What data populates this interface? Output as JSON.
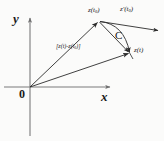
{
  "figure": {
    "kind": "complex-plane-curve-diagram",
    "background_color": "#fbfbfa",
    "ink_color": "#2b2b2b",
    "width": 164,
    "height": 141,
    "axes": {
      "x_label": "x",
      "y_label": "y",
      "origin_label": "0",
      "origin_px": [
        30,
        87
      ],
      "x_axis": {
        "from_px": [
          4,
          87
        ],
        "to_px": [
          112,
          87
        ],
        "arrow": true
      },
      "y_axis": {
        "from_px": [
          30,
          133
        ],
        "to_px": [
          30,
          17
        ],
        "arrow": true
      }
    },
    "points": {
      "z_t0": {
        "label_html": "z(t<sub>0</sub>)",
        "label_plain": "z(t0)",
        "px": [
          99,
          21
        ]
      },
      "z_t": {
        "label_html": "z(t)",
        "label_plain": "z(t)",
        "px": [
          130,
          53
        ]
      }
    },
    "vectors": [
      {
        "name": "position-vector-z-t0",
        "label_plain": "z(t0)",
        "from_px": [
          30,
          87
        ],
        "to_px": [
          99,
          21
        ],
        "style": "straight-arrow"
      },
      {
        "name": "position-vector-z-t",
        "label_plain": "z(t)",
        "from_px": [
          30,
          87
        ],
        "to_px": [
          130,
          53
        ],
        "style": "straight-arrow"
      },
      {
        "name": "chord-vector",
        "label_html": "[z(t)-z(t<sub>0</sub>)]",
        "label_plain": "[z(t)-z(t0)]",
        "from_px": [
          99,
          21
        ],
        "to_px": [
          130,
          53
        ],
        "style": "straight-arrow"
      },
      {
        "name": "tangent-vector",
        "label_html": "z&#8242;(t<sub>0</sub>)",
        "label_plain": "z'(t0)",
        "from_px": [
          99,
          21
        ],
        "to_px": [
          160,
          31
        ],
        "style": "straight-arrow"
      }
    ],
    "curve": {
      "name": "curve-C",
      "label": "C",
      "label_px": [
        118,
        37
      ],
      "from_px": [
        99,
        21
      ],
      "to_px": [
        130,
        53
      ],
      "control_px": [
        122,
        26
      ],
      "style": "arc-arrow"
    },
    "labels": {
      "z_t0_label": {
        "px": [
          89,
          8
        ]
      },
      "z_prime_t0_label": {
        "px": [
          121,
          7
        ]
      },
      "chord_label": {
        "px": [
          58,
          44
        ]
      },
      "curve_C_label": {
        "px": [
          116,
          31
        ]
      },
      "z_t_label": {
        "px": [
          134,
          48
        ]
      },
      "x_label": {
        "px": [
          103,
          90
        ]
      },
      "y_label": {
        "px": [
          15,
          16
        ]
      },
      "origin_label": {
        "px": [
          20,
          88
        ]
      }
    }
  }
}
